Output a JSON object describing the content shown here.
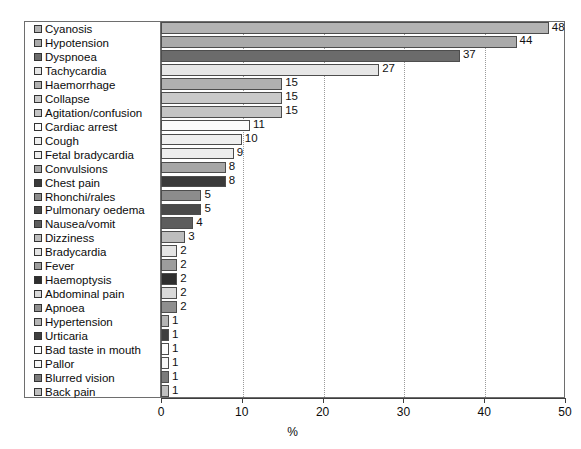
{
  "chart_data": {
    "type": "bar",
    "orientation": "horizontal",
    "title": "",
    "subtitle": "",
    "xlabel": "%",
    "ylabel": "",
    "xlim": [
      0,
      50
    ],
    "xticks": [
      0,
      10,
      20,
      30,
      40,
      50
    ],
    "xtick_labels": [
      "0",
      "10",
      "20",
      "30",
      "40",
      "50"
    ],
    "grid": "vertical-dotted",
    "legend_position": "left-inside",
    "value_labels": true,
    "categories": [
      "Cyanosis",
      "Hypotension",
      "Dyspnoea",
      "Tachycardia",
      "Haemorrhage",
      "Collapse",
      "Agitation/confusion",
      "Cardiac arrest",
      "Cough",
      "Fetal bradycardia",
      "Convulsions",
      "Chest pain",
      "Rhonchi/rales",
      "Pulmonary oedema",
      "Nausea/vomit",
      "Dizziness",
      "Bradycardia",
      "Fever",
      "Haemoptysis",
      "Abdominal pain",
      "Apnoea",
      "Hypertension",
      "Urticaria",
      "Bad taste in mouth",
      "Pallor",
      "Blurred vision",
      "Back pain"
    ],
    "values": [
      48,
      44,
      37,
      27,
      15,
      15,
      15,
      11,
      10,
      9,
      8,
      8,
      5,
      5,
      4,
      3,
      2,
      2,
      2,
      2,
      2,
      1,
      1,
      1,
      1,
      1,
      1
    ],
    "value_label_texts": [
      "48",
      "44",
      "37",
      "27",
      "15",
      "15",
      "15",
      "11",
      "10",
      "9",
      "8",
      "8",
      "5",
      "5",
      "4",
      "3",
      "2",
      "2",
      "2",
      "2",
      "2",
      "1",
      "1",
      "1",
      "1",
      "1",
      "1"
    ],
    "colors": [
      "#b3b3b3",
      "#aaaaaa",
      "#6b6b6b",
      "#e6e6e6",
      "#b0b0b0",
      "#c9c9c9",
      "#c4c4c4",
      "#fbfbfb",
      "#efefef",
      "#ededed",
      "#a6a6a6",
      "#3a3a3a",
      "#8c8c8c",
      "#4a4a4a",
      "#5d5d5d",
      "#bdbdbd",
      "#e4e4e4",
      "#9d9d9d",
      "#2e2e2e",
      "#d9d9d9",
      "#8f8f8f",
      "#b5b5b5",
      "#3f3f3f",
      "#fcfcfc",
      "#f7f7f7",
      "#7b7b7b",
      "#c0c0c0"
    ]
  },
  "axis": {
    "x_title": "%"
  }
}
